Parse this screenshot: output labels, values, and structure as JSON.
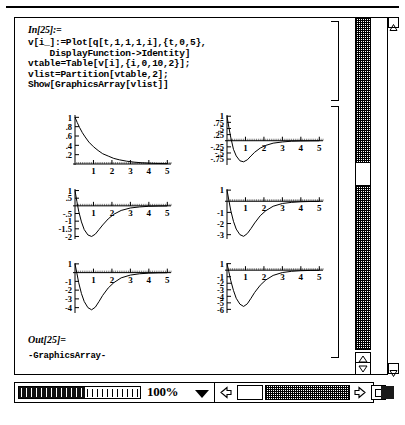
{
  "window": {
    "zoom_level": "100%",
    "icons": {
      "scroll_up": "scroll-up-arrow-icon",
      "scroll_down": "scroll-down-arrow-icon",
      "scroll_left": "scroll-left-arrow-icon",
      "scroll_right": "scroll-right-arrow-icon",
      "zoom_dropdown": "chevron-down-icon",
      "resize": "resize-grip-icon",
      "grow": "grow-box-icon"
    }
  },
  "notebook": {
    "input_label": "In[25]:=",
    "code_lines": [
      "v[i_]:=Plot[q[t,1,1,1,i],{t,0,5},",
      "    DisplayFunction->Identity]",
      "vtable=Table[v[i],{i,0,10,2}];",
      "vlist=Partition[vtable,2];",
      "Show[GraphicsArray[vlist]]"
    ],
    "output_label": "Out[25]=",
    "output_text": "-GraphicsArray-"
  },
  "chart_data": [
    {
      "type": "line",
      "title": "",
      "xlabel": "",
      "ylabel": "",
      "xlim": [
        0,
        5.2
      ],
      "ylim": [
        0,
        1.05
      ],
      "xticks": [
        1,
        2,
        3,
        4,
        5
      ],
      "yticks": [
        0.2,
        0.4,
        0.6,
        0.8,
        1
      ],
      "grid": false,
      "series": [
        {
          "name": "q[t,1,1,1,0]",
          "x": [
            0,
            0.12,
            0.25,
            0.4,
            0.55,
            0.75,
            1,
            1.25,
            1.5,
            1.8,
            2.1,
            2.4,
            2.8,
            3.2,
            3.6,
            4,
            4.5,
            5
          ],
          "y": [
            1,
            0.89,
            0.78,
            0.67,
            0.58,
            0.47,
            0.37,
            0.29,
            0.22,
            0.17,
            0.12,
            0.09,
            0.06,
            0.04,
            0.027,
            0.018,
            0.011,
            0.007
          ]
        }
      ]
    },
    {
      "type": "line",
      "title": "",
      "xlabel": "",
      "ylabel": "",
      "xlim": [
        0,
        5.2
      ],
      "ylim": [
        -0.95,
        1.05
      ],
      "xticks": [
        1,
        2,
        3,
        4,
        5
      ],
      "yticks": [
        1,
        0.75,
        0.5,
        0.25,
        -0.25,
        -0.5,
        -0.75
      ],
      "grid": false,
      "series": [
        {
          "name": "q[t,1,1,1,2]",
          "x": [
            0,
            0.1,
            0.2,
            0.35,
            0.5,
            0.7,
            0.9,
            1.1,
            1.3,
            1.5,
            1.8,
            2.1,
            2.5,
            3,
            3.5,
            4,
            4.5,
            5
          ],
          "y": [
            1,
            0.55,
            0.15,
            -0.35,
            -0.62,
            -0.82,
            -0.86,
            -0.78,
            -0.62,
            -0.47,
            -0.3,
            -0.19,
            -0.1,
            -0.05,
            -0.02,
            -0.01,
            -0.005,
            -0.002
          ]
        }
      ]
    },
    {
      "type": "line",
      "title": "",
      "xlabel": "",
      "ylabel": "",
      "xlim": [
        0,
        5.2
      ],
      "ylim": [
        -2.1,
        1.1
      ],
      "xticks": [
        1,
        2,
        3,
        4,
        5
      ],
      "yticks": [
        1,
        0.5,
        -0.5,
        -1,
        -1.5,
        -2
      ],
      "grid": false,
      "series": [
        {
          "name": "q[t,1,1,1,4]",
          "x": [
            0,
            0.1,
            0.2,
            0.35,
            0.5,
            0.7,
            0.9,
            1.1,
            1.3,
            1.5,
            1.8,
            2.1,
            2.5,
            3,
            3.5,
            4,
            4.5,
            5
          ],
          "y": [
            1,
            0.3,
            -0.35,
            -1.05,
            -1.55,
            -1.9,
            -2.0,
            -1.85,
            -1.55,
            -1.25,
            -0.85,
            -0.55,
            -0.3,
            -0.14,
            -0.07,
            -0.03,
            -0.015,
            -0.007
          ]
        }
      ]
    },
    {
      "type": "line",
      "title": "",
      "xlabel": "",
      "ylabel": "",
      "xlim": [
        0,
        5.2
      ],
      "ylim": [
        -3.3,
        1.1
      ],
      "xticks": [
        1,
        2,
        3,
        4,
        5
      ],
      "yticks": [
        1,
        -1,
        -2,
        -3
      ],
      "grid": false,
      "series": [
        {
          "name": "q[t,1,1,1,6]",
          "x": [
            0,
            0.1,
            0.2,
            0.35,
            0.5,
            0.7,
            0.9,
            1.1,
            1.3,
            1.5,
            1.8,
            2.1,
            2.5,
            3,
            3.5,
            4,
            4.5,
            5
          ],
          "y": [
            1,
            0.1,
            -0.8,
            -1.8,
            -2.5,
            -3.0,
            -3.15,
            -2.9,
            -2.45,
            -1.95,
            -1.3,
            -0.85,
            -0.45,
            -0.2,
            -0.1,
            -0.045,
            -0.02,
            -0.01
          ]
        }
      ]
    },
    {
      "type": "line",
      "title": "",
      "xlabel": "",
      "ylabel": "",
      "xlim": [
        0,
        5.2
      ],
      "ylim": [
        -4.5,
        1.1
      ],
      "xticks": [
        1,
        2,
        3,
        4,
        5
      ],
      "yticks": [
        1,
        -1,
        -2,
        -3,
        -4
      ],
      "grid": false,
      "series": [
        {
          "name": "q[t,1,1,1,8]",
          "x": [
            0,
            0.1,
            0.2,
            0.35,
            0.5,
            0.7,
            0.9,
            1.1,
            1.3,
            1.5,
            1.8,
            2.1,
            2.5,
            3,
            3.5,
            4,
            4.5,
            5
          ],
          "y": [
            1,
            -0.05,
            -1.15,
            -2.4,
            -3.3,
            -4.0,
            -4.25,
            -3.95,
            -3.3,
            -2.6,
            -1.75,
            -1.15,
            -0.6,
            -0.28,
            -0.13,
            -0.06,
            -0.028,
            -0.013
          ]
        }
      ]
    },
    {
      "type": "line",
      "title": "",
      "xlabel": "",
      "ylabel": "",
      "xlim": [
        0,
        5.2
      ],
      "ylim": [
        -6.4,
        1.1
      ],
      "xticks": [
        1,
        2,
        3,
        4,
        5
      ],
      "yticks": [
        1,
        -1,
        -2,
        -3,
        -4,
        -5,
        -6
      ],
      "grid": false,
      "series": [
        {
          "name": "q[t,1,1,1,10]",
          "x": [
            0,
            0.1,
            0.2,
            0.35,
            0.5,
            0.7,
            0.9,
            1.1,
            1.3,
            1.5,
            1.8,
            2.1,
            2.5,
            3,
            3.5,
            4,
            4.5,
            5
          ],
          "y": [
            1,
            -0.25,
            -1.55,
            -3.1,
            -4.3,
            -5.2,
            -5.55,
            -5.15,
            -4.3,
            -3.4,
            -2.3,
            -1.5,
            -0.8,
            -0.36,
            -0.17,
            -0.08,
            -0.036,
            -0.017
          ]
        }
      ]
    }
  ]
}
